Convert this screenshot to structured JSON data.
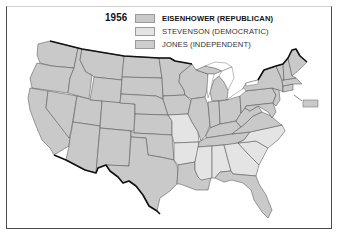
{
  "map": {
    "title_year": "1956",
    "colors": {
      "republican": "#c9c9c9",
      "democratic": "#e4e4e4",
      "independent": "#cdcdcd",
      "border": "#555555",
      "coast": "#111111"
    },
    "legend": [
      {
        "candidate": "EISENHOWER (REPUBLICAN)",
        "party": "republican",
        "bold": true
      },
      {
        "candidate": "STEVENSON (DEMOCRATIC)",
        "party": "democratic",
        "bold": false
      },
      {
        "candidate": "JONES (INDEPENDENT)",
        "party": "independent",
        "bold": false
      }
    ],
    "democratic_states": [
      "Missouri",
      "Arkansas",
      "Mississippi",
      "Alabama",
      "Georgia",
      "South Carolina",
      "North Carolina"
    ],
    "republican_states": [
      "Washington",
      "Oregon",
      "California",
      "Nevada",
      "Idaho",
      "Montana",
      "Wyoming",
      "Utah",
      "Arizona",
      "Colorado",
      "New Mexico",
      "North Dakota",
      "South Dakota",
      "Nebraska",
      "Kansas",
      "Oklahoma",
      "Texas",
      "Minnesota",
      "Iowa",
      "Louisiana",
      "Wisconsin",
      "Illinois",
      "Michigan",
      "Indiana",
      "Ohio",
      "Kentucky",
      "Tennessee",
      "West Virginia",
      "Virginia",
      "Florida",
      "Pennsylvania",
      "New York",
      "Maryland",
      "Delaware",
      "New Jersey",
      "Connecticut",
      "Rhode Island",
      "Massachusetts",
      "Vermont",
      "New Hampshire",
      "Maine"
    ],
    "inset_label": "District of Columbia / small states box"
  }
}
